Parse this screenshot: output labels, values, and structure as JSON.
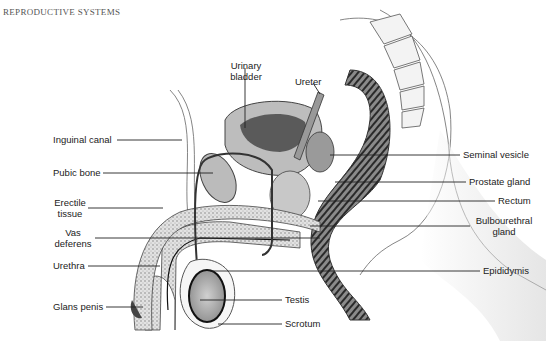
{
  "header": {
    "title": "REPRODUCTIVE SYSTEMS"
  },
  "diagram": {
    "labels_left": [
      {
        "id": "inguinal-canal",
        "text": "Inguinal canal"
      },
      {
        "id": "pubic-bone",
        "text": "Pubic bone"
      },
      {
        "id": "erectile-tissue",
        "line1": "Erectile",
        "line2": "tissue"
      },
      {
        "id": "vas-deferens",
        "line1": "Vas",
        "line2": "deferens"
      },
      {
        "id": "urethra",
        "text": "Urethra"
      },
      {
        "id": "glans-penis",
        "text": "Glans penis"
      }
    ],
    "labels_top": [
      {
        "id": "urinary-bladder",
        "line1": "Urinary",
        "line2": "bladder"
      },
      {
        "id": "ureter",
        "text": "Ureter"
      }
    ],
    "labels_right": [
      {
        "id": "seminal-vesicle",
        "text": "Seminal vesicle"
      },
      {
        "id": "prostate-gland",
        "text": "Prostate gland"
      },
      {
        "id": "rectum",
        "text": "Rectum"
      },
      {
        "id": "bulbourethral-gland",
        "line1": "Bulbourethral",
        "line2": "gland"
      },
      {
        "id": "epididymis",
        "text": "Epididymis"
      }
    ],
    "labels_bottom": [
      {
        "id": "testis",
        "text": "Testis"
      },
      {
        "id": "scrotum",
        "text": "Scrotum"
      }
    ]
  }
}
